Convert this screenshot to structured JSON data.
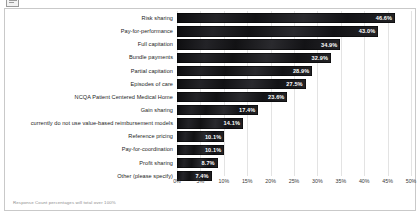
{
  "icons": {
    "window_icon": "window-icon"
  },
  "footnote": "Response Count percentages will total over 100%",
  "axis": {
    "ticks": [
      "0%",
      "5%",
      "10%",
      "15%",
      "20%",
      "25%",
      "30%",
      "35%",
      "40%",
      "45%",
      "50%"
    ]
  },
  "chart_data": {
    "type": "bar",
    "orientation": "horizontal",
    "title": "",
    "subtitle": "",
    "xlabel": "",
    "ylabel": "",
    "xlim": [
      0,
      50
    ],
    "grid": true,
    "legend": "none",
    "annotation": "Response Count percentages will total over 100%",
    "tick_labels": [
      "0%",
      "5%",
      "10%",
      "15%",
      "20%",
      "25%",
      "30%",
      "35%",
      "40%",
      "45%",
      "50%"
    ],
    "categories": [
      "Risk sharing",
      "Pay-for-performance",
      "Full capitation",
      "Bundle payments",
      "Partial capitation",
      "Episodes of care",
      "NCQA Patient Centered Medical Home",
      "Gain sharing",
      "currently do not use value-based reimbursement models",
      "Reference pricing",
      "Pay-for-coordination",
      "Profit sharing",
      "Other (please specify)"
    ],
    "values": [
      46.6,
      43.0,
      34.9,
      32.9,
      28.9,
      27.5,
      23.6,
      17.4,
      14.1,
      10.1,
      10.1,
      8.7,
      7.4
    ],
    "value_labels": [
      "46.6%",
      "43.0%",
      "34.9%",
      "32.9%",
      "28.9%",
      "27.5%",
      "23.6%",
      "17.4%",
      "14.1%",
      "10.1%",
      "10.1%",
      "8.7%",
      "7.4%"
    ],
    "bar_color": "#17171a",
    "value_label_color": "#ffffff"
  }
}
